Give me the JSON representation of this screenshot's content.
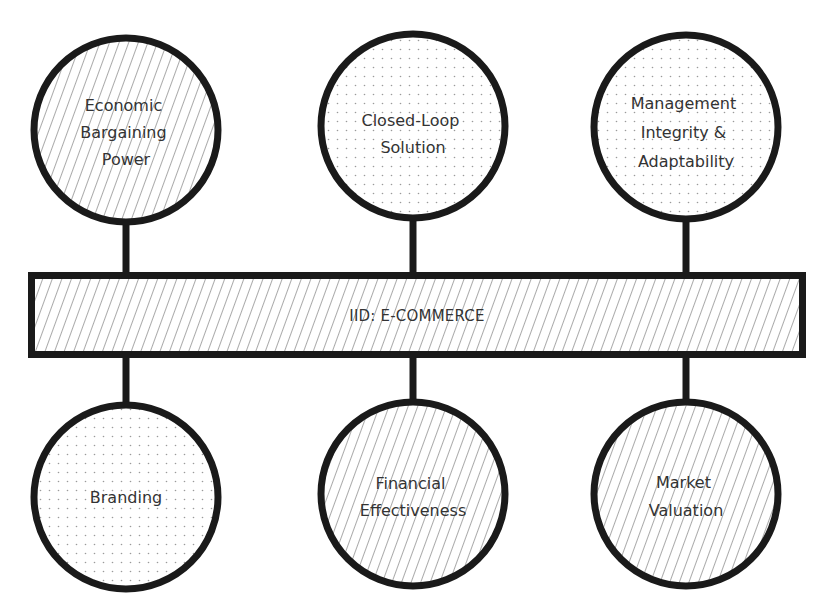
{
  "diagram": {
    "title": "IID: E-COMMERCE",
    "colors": {
      "stroke": "#1a1a1a",
      "hatch": "#555555",
      "dots": "#9a9a9a",
      "text": "#333333",
      "background": "#ffffff"
    },
    "central_bar": {
      "label": "IID: E-COMMERCE",
      "fill": "hatch",
      "x": 28,
      "y": 272,
      "width": 778,
      "height": 86
    },
    "top_nodes": [
      {
        "id": "economic-bargaining-power",
        "lines": [
          "Economic",
          "Bargaining",
          "Power"
        ],
        "fill": "hatch",
        "cx": 126,
        "cy": 130,
        "r": 94
      },
      {
        "id": "closed-loop-solution",
        "lines": [
          "Closed-Loop",
          "Solution"
        ],
        "fill": "dots",
        "cx": 413,
        "cy": 126,
        "r": 94
      },
      {
        "id": "management-integrity-adaptability",
        "lines": [
          "Management",
          "Integrity &",
          "Adaptability"
        ],
        "fill": "dots",
        "cx": 686,
        "cy": 127,
        "r": 94
      }
    ],
    "bottom_nodes": [
      {
        "id": "branding",
        "lines": [
          "Branding"
        ],
        "fill": "dots",
        "cx": 126,
        "cy": 497,
        "r": 94
      },
      {
        "id": "financial-effectiveness",
        "lines": [
          "Financial",
          "Effectiveness"
        ],
        "fill": "hatch",
        "cx": 413,
        "cy": 494,
        "r": 94
      },
      {
        "id": "market-valuation",
        "lines": [
          "Market",
          "Valuation"
        ],
        "fill": "hatch",
        "cx": 686,
        "cy": 494,
        "r": 94
      }
    ]
  }
}
